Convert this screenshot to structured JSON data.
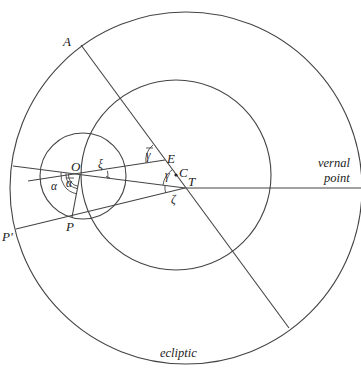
{
  "diagram": {
    "type": "geometric-astronomy-figure",
    "circles": [
      {
        "name": "ecliptic",
        "role": "outer circle"
      },
      {
        "name": "deferent",
        "role": "middle circle centered near C"
      },
      {
        "name": "epicycle",
        "role": "small circle centered at O"
      }
    ],
    "points": {
      "A": "A",
      "O": "O",
      "E": "E",
      "C": "C",
      "T": "T",
      "P": "P",
      "P_prime": "P′"
    },
    "angles": {
      "alpha": "α",
      "alpha_bar": "ᾱ",
      "xi": "ξ",
      "gamma": "γ",
      "gamma_bar": "γ̄",
      "zeta": "ζ"
    },
    "labels": {
      "vernal_line1": "vernal",
      "vernal_line2": "point",
      "ecliptic": "ecliptic"
    }
  }
}
